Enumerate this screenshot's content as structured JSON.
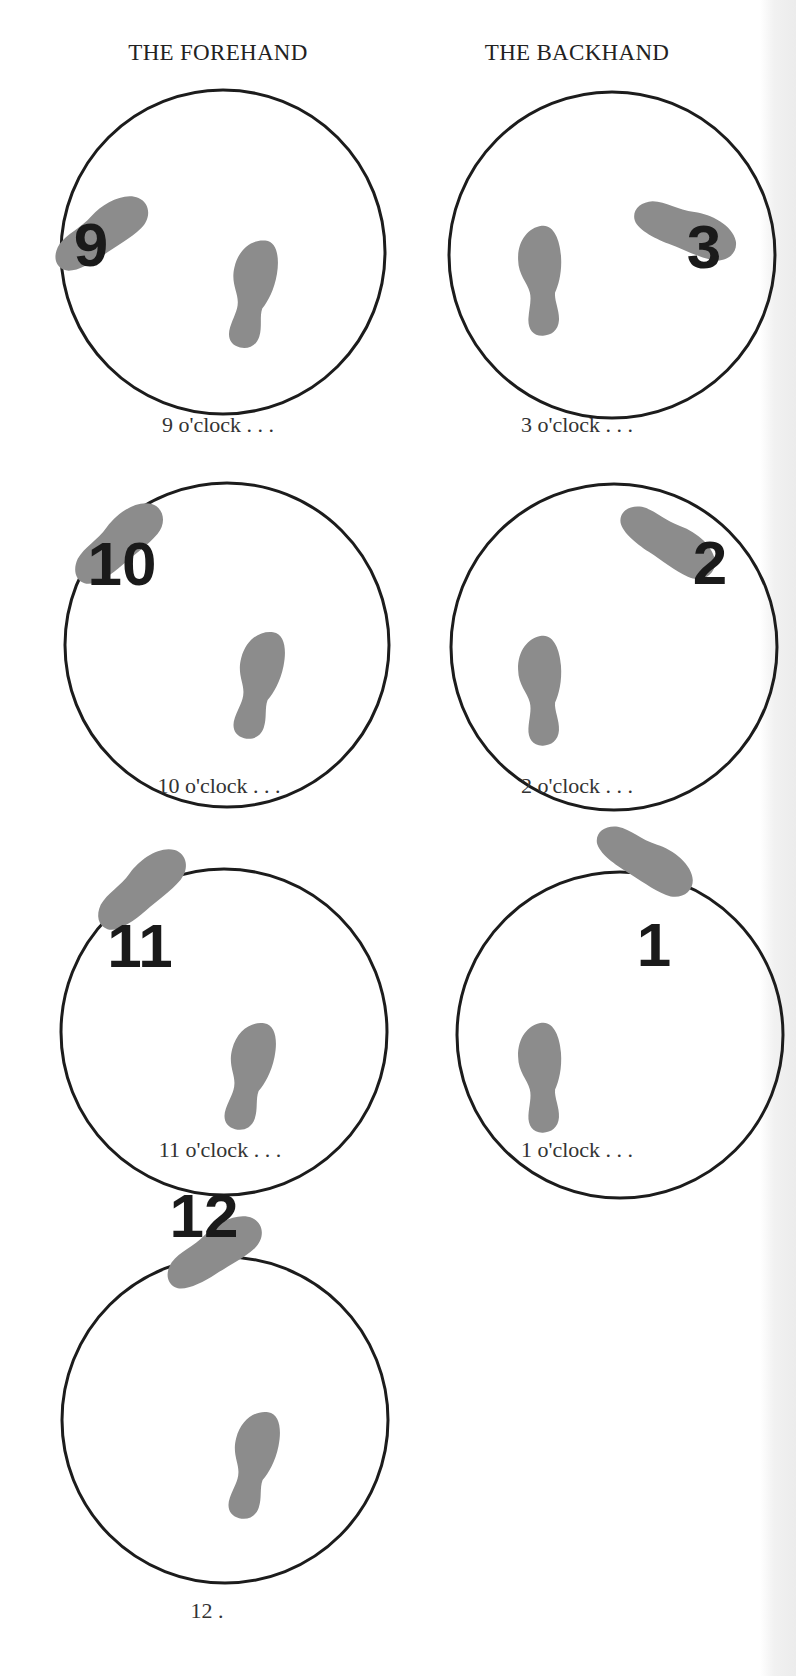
{
  "headings": {
    "forehand": "THE FOREHAND",
    "backhand": "THE BACKHAND"
  },
  "colors": {
    "ring": "#1c1c1c",
    "footprint": "#8c8c8c",
    "numeral": "#1a1a1a",
    "text": "#333333",
    "background": "#ffffff"
  },
  "diagrams": [
    {
      "side": "forehand",
      "numeral": "9",
      "caption": "9 o'clock . . ."
    },
    {
      "side": "backhand",
      "numeral": "3",
      "caption": "3 o'clock . . ."
    },
    {
      "side": "forehand",
      "numeral": "10",
      "caption": "10 o'clock . . ."
    },
    {
      "side": "backhand",
      "numeral": "2",
      "caption": "2 o'clock . . ."
    },
    {
      "side": "forehand",
      "numeral": "11",
      "caption": "11 o'clock . . ."
    },
    {
      "side": "backhand",
      "numeral": "1",
      "caption": "1 o'clock . . ."
    },
    {
      "side": "forehand",
      "numeral": "12",
      "caption": "12 ."
    }
  ]
}
